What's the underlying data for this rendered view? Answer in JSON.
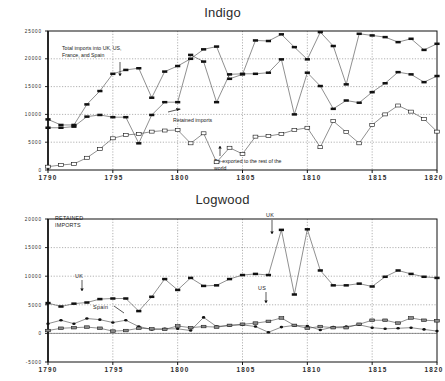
{
  "figure": {
    "panels": [
      {
        "id": "indigo",
        "title": "Indigo",
        "xlabel": "",
        "ylabel": "",
        "yticks": [
          "0",
          "5000",
          "10000",
          "15000",
          "20000",
          "25000"
        ],
        "xticks": [
          "1790",
          "1795",
          "1800",
          "1805",
          "1810",
          "1815",
          "1820"
        ],
        "annotations": [
          {
            "id": "total-imports",
            "text": "Total imports into UK, US,\nFrance, and Spain"
          },
          {
            "id": "retained-imports",
            "text": "Retained imports"
          },
          {
            "id": "re-exported",
            "text": "Re-exported to the rest of the\nworld"
          }
        ]
      },
      {
        "id": "logwood",
        "title": "Logwood",
        "xlabel": "",
        "ylabel": "",
        "yticks": [
          "-5000",
          "0",
          "5000",
          "10000",
          "15000",
          "20000"
        ],
        "xticks": [
          "1790",
          "1795",
          "1800",
          "1805",
          "1810",
          "1815",
          "1820"
        ],
        "annotations": [
          {
            "id": "retained-imports-caption",
            "text": "RETAINED\nIMPORTS"
          },
          {
            "id": "uk-left",
            "text": "UK"
          },
          {
            "id": "uk-right",
            "text": "UK"
          },
          {
            "id": "spain",
            "text": "Spain"
          },
          {
            "id": "us",
            "text": "US"
          }
        ]
      }
    ]
  },
  "chart_data": [
    {
      "type": "line",
      "title": "Indigo",
      "xlabel": "",
      "ylabel": "",
      "xlim": [
        1790,
        1820
      ],
      "ylim": [
        0,
        25000
      ],
      "grid": true,
      "legend": "annotations",
      "x": [
        1790,
        1791,
        1792,
        1793,
        1794,
        1795,
        1796,
        1797,
        1798,
        1799,
        1800,
        1801,
        1802,
        1803,
        1804,
        1805,
        1806,
        1807,
        1808,
        1809,
        1810,
        1811,
        1812,
        1813,
        1814,
        1815,
        1816,
        1817,
        1818,
        1819,
        1820
      ],
      "series": [
        {
          "name": "Total imports into UK, US, France, and Spain",
          "marker": "filled-square",
          "values": [
            9100,
            8100,
            8100,
            11800,
            14200,
            17300,
            18000,
            18300,
            13000,
            17700,
            18700,
            20000,
            21700,
            22200,
            16400,
            17200,
            23300,
            23200,
            24400,
            22100,
            19900,
            24800,
            22300,
            15400,
            24500,
            24200,
            23900,
            23000,
            23600,
            21600,
            22700
          ]
        },
        {
          "name": "Retained imports",
          "marker": "filled-square",
          "values": [
            7600,
            7600,
            7800,
            9600,
            9900,
            9500,
            9500,
            4800,
            9900,
            12200,
            12200,
            20700,
            19500,
            12200,
            17200,
            17300,
            17300,
            17500,
            19900,
            10000,
            17500,
            15100,
            11000,
            12500,
            12100,
            14000,
            15600,
            17600,
            17200,
            15800,
            16900
          ]
        },
        {
          "name": "Re-exported to the rest of the world",
          "marker": "open-square",
          "values": [
            600,
            900,
            1100,
            2200,
            3800,
            5700,
            6300,
            6500,
            6900,
            7100,
            7200,
            4800,
            6600,
            1400,
            4000,
            2900,
            6000,
            6100,
            6500,
            7200,
            7600,
            4100,
            8800,
            6800,
            4800,
            8100,
            10000,
            11600,
            10500,
            9200,
            6900
          ]
        }
      ]
    },
    {
      "type": "line",
      "title": "Logwood",
      "xlabel": "",
      "ylabel": "",
      "xlim": [
        1790,
        1820
      ],
      "ylim": [
        -5000,
        20000
      ],
      "grid": true,
      "legend": "annotations",
      "x": [
        1790,
        1791,
        1792,
        1793,
        1794,
        1795,
        1796,
        1797,
        1798,
        1799,
        1800,
        1801,
        1802,
        1803,
        1804,
        1805,
        1806,
        1807,
        1808,
        1809,
        1810,
        1811,
        1812,
        1813,
        1814,
        1815,
        1816,
        1817,
        1818,
        1819,
        1820
      ],
      "series": [
        {
          "name": "UK",
          "marker": "filled-square",
          "values": [
            5300,
            4700,
            5200,
            5400,
            6000,
            6100,
            6100,
            3900,
            6400,
            9500,
            7600,
            9700,
            8300,
            8400,
            9500,
            10200,
            10400,
            10200,
            18100,
            6800,
            18200,
            11000,
            8400,
            8400,
            8700,
            8200,
            9900,
            11000,
            10400,
            9900,
            9700
          ]
        },
        {
          "name": "Spain",
          "marker": "filled-circle",
          "values": [
            1700,
            2300,
            1700,
            2600,
            2400,
            1900,
            2300,
            1200,
            700,
            800,
            800,
            500,
            2800,
            1200,
            1400,
            1500,
            1200,
            200,
            1100,
            1400,
            1300,
            600,
            1100,
            1200,
            1500,
            1000,
            800,
            900,
            1000,
            700,
            400
          ]
        },
        {
          "name": "US",
          "marker": "shaded-square",
          "values": [
            500,
            900,
            1000,
            1100,
            900,
            400,
            500,
            900,
            800,
            700,
            1300,
            1000,
            1200,
            1100,
            1400,
            1600,
            1800,
            2100,
            2700,
            1400,
            900,
            1200,
            1000,
            1000,
            1600,
            2300,
            2300,
            1800,
            2700,
            2300,
            2200
          ]
        }
      ]
    }
  ]
}
